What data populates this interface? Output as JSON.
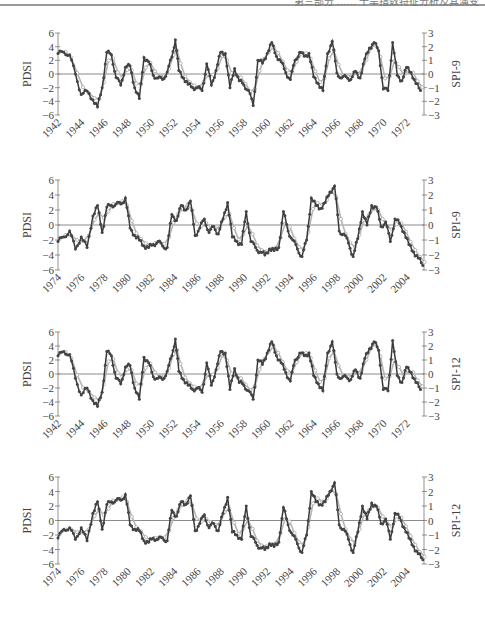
{
  "header": {
    "text": "第三部分 …… 干旱指数特征分析及其演变"
  },
  "chart_data": [
    {
      "type": "line",
      "title": "",
      "left_ylabel": "PDSI",
      "right_ylabel": "SPI-9",
      "left_ylim": [
        -6,
        6
      ],
      "left_yticks": [
        "6",
        "4",
        "2",
        "0",
        "-2",
        "-4",
        "-6"
      ],
      "right_ylim": [
        -3,
        3
      ],
      "right_yticks": [
        "3",
        "2",
        "1",
        "0",
        "-1",
        "-2",
        "-3"
      ],
      "xlim": [
        1942,
        1973.5
      ],
      "xticks": [
        "1942",
        "1944",
        "1946",
        "1948",
        "1950",
        "1952",
        "1954",
        "1956",
        "1958",
        "1960",
        "1962",
        "1964",
        "1966",
        "1968",
        "1970",
        "1972"
      ],
      "series": [
        {
          "name": "PDSI",
          "style": "dark line with filled markers",
          "x": [
            1942,
            1942.5,
            1943,
            1943.5,
            1944,
            1944.5,
            1945,
            1945.4,
            1945.8,
            1946.2,
            1946.6,
            1947,
            1947.4,
            1947.8,
            1948.2,
            1948.6,
            1949,
            1949.4,
            1949.8,
            1950.2,
            1950.6,
            1951,
            1951.4,
            1951.8,
            1952.1,
            1952.4,
            1952.8,
            1953.2,
            1953.6,
            1954,
            1954.4,
            1954.8,
            1955.2,
            1955.6,
            1956,
            1956.4,
            1956.8,
            1957.2,
            1957.6,
            1958,
            1958.4,
            1958.8,
            1959.2,
            1959.6,
            1960,
            1960.4,
            1960.8,
            1961.2,
            1961.6,
            1962,
            1962.4,
            1962.8,
            1963.2,
            1963.6,
            1964,
            1964.4,
            1964.8,
            1965.2,
            1965.6,
            1966,
            1966.4,
            1966.8,
            1967.2,
            1967.6,
            1968,
            1968.4,
            1968.8,
            1969.2,
            1969.6,
            1970,
            1970.4,
            1970.8,
            1971.2,
            1971.6,
            1972,
            1972.4,
            1972.8,
            1973.2
          ],
          "y": [
            3,
            3.2,
            2.8,
            0,
            -3,
            -2.5,
            -3.8,
            -4.8,
            -2,
            3.2,
            2.8,
            -0.5,
            -1.6,
            1,
            1.2,
            -2,
            -3.6,
            2.4,
            1.8,
            -0.2,
            -0.6,
            -0.8,
            0.3,
            2.5,
            5,
            0.5,
            -0.6,
            -1.5,
            -2,
            -2,
            -2.4,
            1.5,
            -1.6,
            0.5,
            3.2,
            3,
            -2,
            0.8,
            -1,
            -1.6,
            -2.4,
            -4.6,
            2,
            1.6,
            3,
            4.6,
            2.6,
            1.8,
            0.2,
            -0.8,
            2,
            3.2,
            2.6,
            3,
            -0.4,
            -1.4,
            -2.4,
            3,
            4.8,
            0.2,
            -0.6,
            -0.4,
            -0.8,
            0.4,
            -0.6,
            2.2,
            3.8,
            4.6,
            3.4,
            -2.2,
            -2.4,
            4.6,
            -0.2,
            -1,
            1,
            0.2,
            -1.4,
            -2.4
          ]
        },
        {
          "name": "SPI-9",
          "style": "light grey open markers",
          "y_axis": "right"
        }
      ]
    },
    {
      "type": "line",
      "title": "",
      "left_ylabel": "PDSI",
      "right_ylabel": "SPI-9",
      "left_ylim": [
        -6,
        6
      ],
      "left_yticks": [
        "6",
        "4",
        "2",
        "0",
        "-2",
        "-4",
        "-6"
      ],
      "right_ylim": [
        -3,
        3
      ],
      "right_yticks": [
        "3",
        "2",
        "1",
        "0",
        "-1",
        "-2",
        "-3"
      ],
      "xlim": [
        1974,
        2005.5
      ],
      "xticks": [
        "1974",
        "1976",
        "1978",
        "1980",
        "1982",
        "1984",
        "1986",
        "1988",
        "1990",
        "1992",
        "1994",
        "1996",
        "1998",
        "2000",
        "2002",
        "2004"
      ],
      "series": [
        {
          "name": "PDSI",
          "style": "dark line with filled markers",
          "x": [
            1974,
            1974.5,
            1975,
            1975.5,
            1976,
            1976.5,
            1977,
            1977.4,
            1977.8,
            1978.2,
            1978.6,
            1979,
            1979.4,
            1979.8,
            1980.2,
            1980.6,
            1981,
            1981.4,
            1981.8,
            1982.2,
            1982.6,
            1983,
            1983.4,
            1983.8,
            1984.2,
            1984.6,
            1985,
            1985.4,
            1985.8,
            1986.2,
            1986.6,
            1987,
            1987.4,
            1987.8,
            1988.2,
            1988.6,
            1989,
            1989.4,
            1989.8,
            1990.2,
            1990.6,
            1991,
            1991.4,
            1991.8,
            1992.2,
            1992.6,
            1993,
            1993.4,
            1993.8,
            1994.2,
            1994.6,
            1995,
            1995.4,
            1995.8,
            1996.2,
            1996.6,
            1997,
            1997.4,
            1997.8,
            1998.2,
            1998.6,
            1999,
            1999.4,
            1999.8,
            2000.2,
            2000.6,
            2001,
            2001.4,
            2001.8,
            2002.2,
            2002.6,
            2003,
            2003.4,
            2003.8,
            2004.2,
            2004.6,
            2005,
            2005.4
          ],
          "y": [
            -2.2,
            -1.6,
            -0.8,
            -3.2,
            -1.6,
            -3,
            1.2,
            2.6,
            -1,
            2.4,
            2.6,
            2.8,
            2.8,
            3.6,
            -0.4,
            -1.4,
            -2,
            -2.8,
            -3,
            -2.6,
            -2.2,
            -2.8,
            -3,
            1.4,
            0.6,
            2.6,
            2,
            3.2,
            -1.4,
            -0.4,
            0.8,
            -1,
            -0.2,
            -1.2,
            0.8,
            3,
            -1.6,
            -2.2,
            -2.6,
            1.8,
            -2.2,
            -3,
            -3.6,
            -4,
            -3.2,
            -3.4,
            -3,
            1.8,
            -0.8,
            -2,
            -3.2,
            -4.2,
            -2,
            3.6,
            2.6,
            2.2,
            3,
            4.4,
            5.2,
            -0.8,
            -1.2,
            -2.4,
            -4.2,
            -1.8,
            1.8,
            0,
            2.6,
            2.4,
            -0.2,
            0.4,
            -2.2,
            0.8,
            0.2,
            -1,
            -2.6,
            -3.6,
            -4.4,
            -5.4
          ]
        },
        {
          "name": "SPI-9",
          "style": "light grey open markers",
          "y_axis": "right"
        }
      ]
    },
    {
      "type": "line",
      "title": "",
      "left_ylabel": "PDSI",
      "right_ylabel": "SPI-12",
      "left_ylim": [
        -6,
        6
      ],
      "left_yticks": [
        "6",
        "4",
        "2",
        "0",
        "-2",
        "-4",
        "-6"
      ],
      "right_ylim": [
        -3,
        3
      ],
      "right_yticks": [
        "3",
        "2",
        "1",
        "0",
        "-1",
        "-2",
        "-3"
      ],
      "xlim": [
        1942,
        1973.5
      ],
      "xticks": [
        "1942",
        "1944",
        "1946",
        "1948",
        "1950",
        "1952",
        "1954",
        "1956",
        "1958",
        "1960",
        "1962",
        "1964",
        "1966",
        "1968",
        "1970",
        "1972"
      ],
      "series": [
        {
          "name": "PDSI",
          "style": "dark line with filled markers",
          "x": [
            1942,
            1942.5,
            1943,
            1943.5,
            1944,
            1944.5,
            1945,
            1945.4,
            1945.8,
            1946.2,
            1946.6,
            1947,
            1947.4,
            1947.8,
            1948.2,
            1948.6,
            1949,
            1949.4,
            1949.8,
            1950.2,
            1950.6,
            1951,
            1951.4,
            1951.8,
            1952.1,
            1952.4,
            1952.8,
            1953.2,
            1953.6,
            1954,
            1954.4,
            1954.8,
            1955.2,
            1955.6,
            1956,
            1956.4,
            1956.8,
            1957.2,
            1957.6,
            1958,
            1958.4,
            1958.8,
            1959.2,
            1959.6,
            1960,
            1960.4,
            1960.8,
            1961.2,
            1961.6,
            1962,
            1962.4,
            1962.8,
            1963.2,
            1963.6,
            1964,
            1964.4,
            1964.8,
            1965.2,
            1965.6,
            1966,
            1966.4,
            1966.8,
            1967.2,
            1967.6,
            1968,
            1968.4,
            1968.8,
            1969.2,
            1969.6,
            1970,
            1970.4,
            1970.8,
            1971.2,
            1971.6,
            1972,
            1972.4,
            1972.8,
            1973.2
          ],
          "y": [
            2.6,
            3.2,
            2.8,
            -0.6,
            -3,
            -2,
            -3.8,
            -4.6,
            -2.6,
            3.2,
            2.6,
            -0.6,
            -1.4,
            1,
            1.2,
            -2,
            -3.6,
            2.4,
            1.6,
            -0.4,
            -0.6,
            -0.8,
            0.4,
            2.6,
            5,
            0.4,
            -0.8,
            -1.6,
            -2.2,
            -2,
            -2.6,
            1.6,
            -1.6,
            0.6,
            3.2,
            3,
            -2.2,
            0.8,
            -1.2,
            -1.6,
            -2.4,
            -3.6,
            2,
            1.4,
            3,
            4.6,
            2.6,
            1.6,
            0.2,
            -1,
            2,
            3,
            2.6,
            3,
            -0.2,
            -1.4,
            -2.4,
            3,
            4.6,
            0,
            -0.6,
            -0.4,
            -0.8,
            0.6,
            -0.6,
            2.2,
            3.6,
            4.6,
            3.4,
            -2.2,
            -2.4,
            4.8,
            -0.2,
            -1.2,
            1,
            0.2,
            -1.2,
            -2.2
          ]
        },
        {
          "name": "SPI-12",
          "style": "light grey open markers",
          "y_axis": "right"
        }
      ]
    },
    {
      "type": "line",
      "title": "",
      "left_ylabel": "PDSI",
      "right_ylabel": "SPI-12",
      "left_ylim": [
        -6,
        6
      ],
      "left_yticks": [
        "6",
        "4",
        "2",
        "0",
        "-2",
        "-4",
        "-6"
      ],
      "right_ylim": [
        -3,
        3
      ],
      "right_yticks": [
        "3",
        "2",
        "1",
        "0",
        "-1",
        "-2",
        "-3"
      ],
      "xlim": [
        1974,
        2005.5
      ],
      "xticks": [
        "1974",
        "1976",
        "1978",
        "1980",
        "1982",
        "1984",
        "1986",
        "1988",
        "1990",
        "1992",
        "1994",
        "1996",
        "1998",
        "2000",
        "2002",
        "2004"
      ],
      "series": [
        {
          "name": "PDSI",
          "style": "dark line with filled markers",
          "x": [
            1974,
            1974.5,
            1975,
            1975.5,
            1976,
            1976.5,
            1977,
            1977.4,
            1977.8,
            1978.2,
            1978.6,
            1979,
            1979.4,
            1979.8,
            1980.2,
            1980.6,
            1981,
            1981.4,
            1981.8,
            1982.2,
            1982.6,
            1983,
            1983.4,
            1983.8,
            1984.2,
            1984.6,
            1985,
            1985.4,
            1985.8,
            1986.2,
            1986.6,
            1987,
            1987.4,
            1987.8,
            1988.2,
            1988.6,
            1989,
            1989.4,
            1989.8,
            1990.2,
            1990.6,
            1991,
            1991.4,
            1991.8,
            1992.2,
            1992.6,
            1993,
            1993.4,
            1993.8,
            1994.2,
            1994.6,
            1995,
            1995.4,
            1995.8,
            1996.2,
            1996.6,
            1997,
            1997.4,
            1997.8,
            1998.2,
            1998.6,
            1999,
            1999.4,
            1999.8,
            2000.2,
            2000.6,
            2001,
            2001.4,
            2001.8,
            2002.2,
            2002.6,
            2003,
            2003.4,
            2003.8,
            2004.2,
            2004.6,
            2005,
            2005.4
          ],
          "y": [
            -2.4,
            -1.2,
            -1,
            -2.6,
            -1,
            -2.8,
            1,
            2.6,
            -1.2,
            2.2,
            2.6,
            2.8,
            2.8,
            3.6,
            -0.6,
            -1.2,
            -1.4,
            -2.8,
            -3,
            -2.4,
            -2.6,
            -2.4,
            -2.8,
            1.4,
            0.6,
            2.6,
            2.2,
            3.4,
            -1.4,
            -0.4,
            0.8,
            -1,
            -0.4,
            -1.4,
            1,
            3.2,
            -1.6,
            -2,
            -2.6,
            2,
            -2.2,
            -3,
            -3.8,
            -4,
            -3.2,
            -3.6,
            -3,
            1.8,
            -0.6,
            -2,
            -3.2,
            -4.4,
            -2,
            4,
            2.6,
            2.2,
            2.6,
            4,
            5.2,
            -0.6,
            -1.2,
            -2.6,
            -4.4,
            -1.6,
            2,
            0.2,
            2.4,
            2,
            -0.4,
            0.2,
            -2.6,
            1,
            0.4,
            -1,
            -2.4,
            -3.6,
            -4.6,
            -5.4
          ]
        },
        {
          "name": "SPI-12",
          "style": "light grey open markers",
          "y_axis": "right"
        }
      ]
    }
  ]
}
